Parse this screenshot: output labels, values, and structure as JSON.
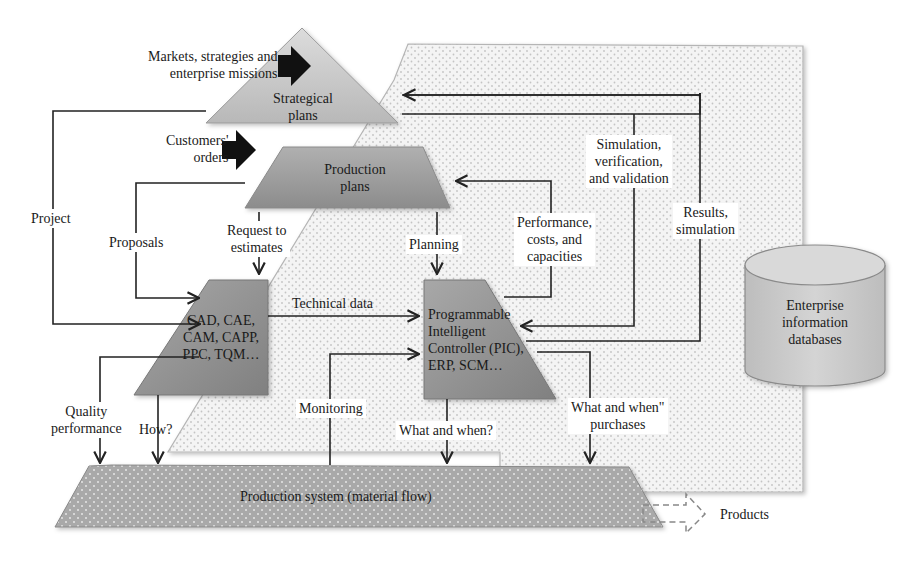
{
  "diagram": {
    "colors": {
      "shape_fill_dark": "#8e8e8e",
      "shape_fill_light": "#cfcfcf",
      "zone_fill": "#f3f3f3",
      "zone_dots": "#c8c8c8",
      "line": "#222222",
      "input_arrow": "#111111"
    },
    "nodes": {
      "strategic": {
        "label_line1": "Strategical",
        "label_line2": "plans",
        "shape": "triangle"
      },
      "production_plans": {
        "label_line1": "Production",
        "label_line2": "plans",
        "shape": "trapezoid"
      },
      "cad": {
        "label_line1": "CAD, CAE,",
        "label_line2": "CAM, CAPP,",
        "label_line3": "PPC, TQM…",
        "shape": "trapezoid-left-slant"
      },
      "pic": {
        "label_line1": "Programmable",
        "label_line2": "Intelligent",
        "label_line3": "Controller (PIC),",
        "label_line4": "ERP, SCM…",
        "shape": "trapezoid-right-slant"
      },
      "production_system": {
        "label": "Production system (material flow)",
        "shape": "trapezoid"
      },
      "databases": {
        "label_line1": "Enterprise",
        "label_line2": "information",
        "label_line3": "databases",
        "shape": "cylinder"
      }
    },
    "inputs": {
      "markets": {
        "line1": "Markets, strategies and",
        "line2": "enterprise missions",
        "icon": "block-arrow-right-icon"
      },
      "customers": {
        "line1": "Customers'",
        "line2": "orders",
        "icon": "block-arrow-right-icon"
      }
    },
    "edges": {
      "project": {
        "label": "Project"
      },
      "proposals": {
        "label": "Proposals"
      },
      "request": {
        "line1": "Request to",
        "line2": "estimates"
      },
      "planning": {
        "label": "Planning"
      },
      "technical_data": {
        "label": "Technical data"
      },
      "performance": {
        "line1": "Performance,",
        "line2": "costs, and",
        "line3": "capacities"
      },
      "simulation": {
        "line1": "Simulation,",
        "line2": "verification,",
        "line3": "and validation"
      },
      "results": {
        "line1": "Results,",
        "line2": "simulation"
      },
      "quality": {
        "line1": "Quality",
        "line2": "performance"
      },
      "how": {
        "label": "How?"
      },
      "monitoring": {
        "label": "Monitoring"
      },
      "what_when": {
        "label": "What and when?"
      },
      "what_when_purchases": {
        "line1": "What and when\"",
        "line2": "purchases"
      }
    },
    "output": {
      "label": "Products",
      "icon": "dashed-arrow-right-icon"
    }
  }
}
